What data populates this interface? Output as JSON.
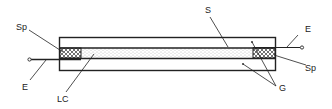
{
  "diagram": {
    "type": "cross-section",
    "labels": {
      "sp_left": "Sp",
      "sp_right": "Sp",
      "e_left": "E",
      "e_right": "E",
      "s": "S",
      "lc": "LC",
      "g": "G"
    },
    "components": [
      {
        "id": "G",
        "name": "glass substrates (upper and lower)"
      },
      {
        "id": "S",
        "name": "spacer/sealed layer top boundary"
      },
      {
        "id": "LC",
        "name": "liquid crystal layer (stippled)"
      },
      {
        "id": "Sp",
        "name": "spacers / seals (cross-hatched, both ends)"
      },
      {
        "id": "E",
        "name": "electrode leads (left and right)"
      }
    ],
    "colors": {
      "line": "#222222",
      "fill": "#ffffff",
      "stipple": "#888888"
    }
  }
}
